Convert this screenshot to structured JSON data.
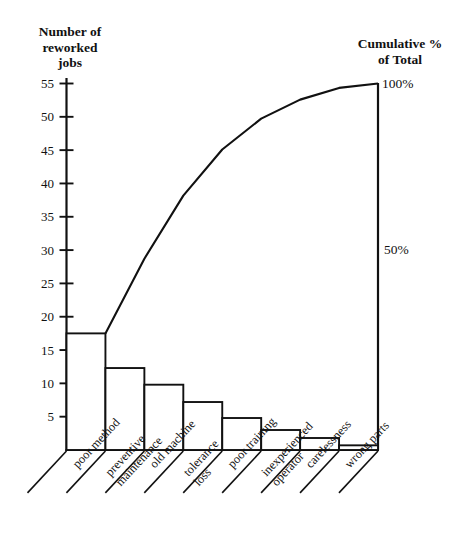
{
  "chart_data": {
    "type": "bar",
    "title": "",
    "subtitle": "",
    "ylabel": "Number of\nreworked\njobs",
    "ylabel_right": "Cumulative %\nof Total",
    "xlabel": "",
    "categories": [
      "poor method",
      "preventive maintenance",
      "old machine",
      "tolerance loss",
      "poor training",
      "inexperienced operator",
      "carelessness",
      "wrong parts"
    ],
    "category_lines": [
      [
        "poor method"
      ],
      [
        "preventive",
        "maintenance"
      ],
      [
        "old machine"
      ],
      [
        "tolerance",
        "loss"
      ],
      [
        "poor training"
      ],
      [
        "inexperienced",
        "operator"
      ],
      [
        "carelessness"
      ],
      [
        "wrong parts"
      ]
    ],
    "values": [
      17.5,
      12.3,
      9.8,
      7.2,
      4.8,
      3.0,
      1.8,
      0.7
    ],
    "cumulative_values": [
      17.5,
      29.8,
      39.6,
      46.8,
      51.6,
      54.6,
      56.4,
      57.1
    ],
    "cumulative_percent": [
      30.6,
      52.2,
      69.4,
      82.0,
      90.4,
      95.6,
      98.8,
      100.0
    ],
    "ylim": [
      0,
      57.1
    ],
    "yticks": [
      5,
      10,
      15,
      20,
      25,
      30,
      35,
      40,
      45,
      50,
      55
    ],
    "ytick_labels": [
      "5",
      "10",
      "15",
      "20",
      "25",
      "30",
      "35",
      "40",
      "45",
      "50",
      "55"
    ],
    "right_axis_labels": [
      "100%",
      "50%"
    ],
    "right_axis_values": [
      100,
      50
    ],
    "grid": false,
    "legend": "none",
    "series": [
      {
        "name": "Number of reworked jobs",
        "type": "bar",
        "values": [
          17.5,
          12.3,
          9.8,
          7.2,
          4.8,
          3.0,
          1.8,
          0.7
        ]
      },
      {
        "name": "Cumulative % of Total",
        "type": "line",
        "values": [
          30.6,
          52.2,
          69.4,
          82.0,
          90.4,
          95.6,
          98.8,
          100.0
        ]
      }
    ]
  },
  "colors": {
    "ink": "#111111",
    "background": "#ffffff"
  }
}
